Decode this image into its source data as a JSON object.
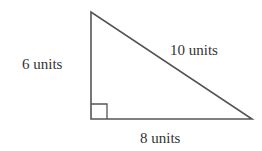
{
  "diagram": {
    "type": "right-triangle",
    "labels": {
      "vertical_leg": "6 units",
      "horizontal_leg": "8 units",
      "hypotenuse": "10 units"
    },
    "colors": {
      "stroke": "#555555",
      "text": "#333333",
      "background": "#ffffff"
    }
  }
}
